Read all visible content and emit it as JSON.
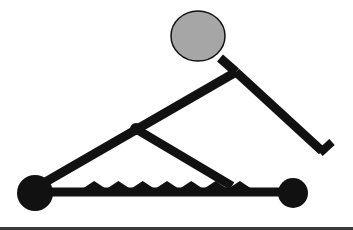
{
  "diagram": {
    "colors": {
      "stroke": "#111111",
      "head_fill": "#a6a6a6",
      "background": "#ffffff",
      "bottom_rule": "#3a3a3a"
    },
    "parts": {
      "head": {
        "cx": 198,
        "cy": 36,
        "rx": 27,
        "ry": 25
      },
      "neck": {
        "x1": 220,
        "y1": 58,
        "x2": 236,
        "y2": 72
      },
      "torso_thigh": {
        "x1": 236,
        "y1": 72,
        "x2": 42,
        "y2": 184
      },
      "knee_joint": {
        "cx": 136,
        "cy": 129,
        "r": 6
      },
      "arm": {
        "x1": 236,
        "y1": 72,
        "x2": 322,
        "y2": 151
      },
      "hand": {
        "x1": 320,
        "y1": 153,
        "x2": 332,
        "y2": 142
      },
      "shin": {
        "x1": 136,
        "y1": 129,
        "x2": 232,
        "y2": 186
      },
      "rail": {
        "x1": 35,
        "y1": 192,
        "x2": 292,
        "y2": 192,
        "width": 9
      },
      "left_wheel": {
        "cx": 35,
        "cy": 193,
        "r": 18
      },
      "right_wheel": {
        "cx": 293,
        "cy": 193,
        "r": 15
      },
      "teeth": {
        "start_x": 82,
        "end_x": 252,
        "count": 7,
        "base_y": 189,
        "height": 8
      }
    }
  }
}
